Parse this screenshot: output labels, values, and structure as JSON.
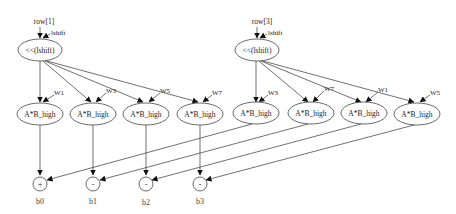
{
  "diagram": {
    "groups": [
      {
        "input_label": "row[1]",
        "shift_edge_label": "lshift",
        "shift_node_label": "<<(lshift)",
        "multipliers": [
          {
            "label": "A*B_high",
            "weight_label": "W1"
          },
          {
            "label": "A*B_high",
            "weight_label": "W3"
          },
          {
            "label": "A*B_high",
            "weight_label": "W5"
          },
          {
            "label": "A*B_high",
            "weight_label": "W7"
          }
        ]
      },
      {
        "input_label": "row[3]",
        "shift_edge_label": "lshift",
        "shift_node_label": "<<(lshift)",
        "multipliers": [
          {
            "label": "A*B_high",
            "weight_label": "W3"
          },
          {
            "label": "A*B_high",
            "weight_label": "W7"
          },
          {
            "label": "A*B_high",
            "weight_label": "W1"
          },
          {
            "label": "A*B_high",
            "weight_label": "W5"
          }
        ]
      }
    ],
    "outputs": [
      {
        "op": "+",
        "label": "b0"
      },
      {
        "op": "-",
        "label": "b1"
      },
      {
        "op": "-",
        "label": "b2"
      },
      {
        "op": "-",
        "label": "b3"
      }
    ]
  }
}
